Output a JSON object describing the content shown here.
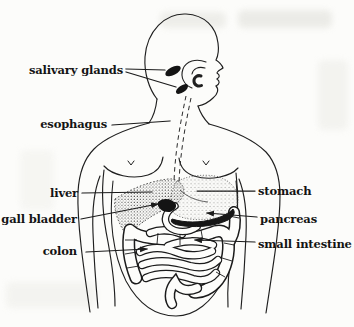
{
  "page": {
    "type": "scanned textbook figure",
    "paper_color": "#fcfcfa",
    "ink_color": "#1b1b1b"
  },
  "diagram": {
    "labels": {
      "salivary_glands": "salivary glands",
      "esophagus": "esophagus",
      "liver": "liver",
      "gall_bladder": "gall bladder",
      "colon": "colon",
      "stomach": "stomach",
      "pancreas": "pancreas",
      "small_intestine": "small intestine"
    }
  }
}
